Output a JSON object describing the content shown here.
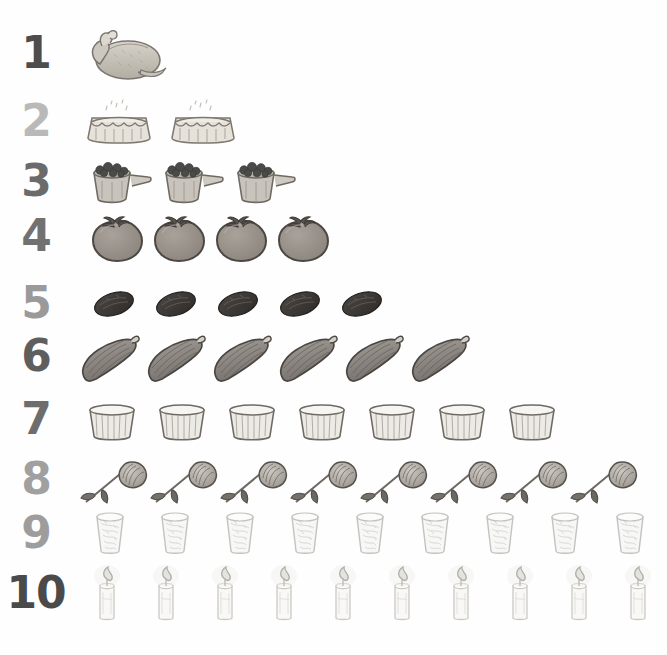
{
  "page": {
    "background_color": "#ffffff",
    "width": 667,
    "height": 655
  },
  "chart_data": {
    "type": "bar",
    "xlabel": "",
    "ylabel": "",
    "categories": [
      "1",
      "2",
      "3",
      "4",
      "5",
      "6",
      "7",
      "8",
      "9",
      "10"
    ],
    "values": [
      1,
      2,
      3,
      4,
      5,
      6,
      7,
      8,
      9,
      10
    ],
    "ylim": [
      0,
      10
    ],
    "grid": false,
    "legend": "none",
    "note": "Pictograph: each row shows N hand-drawn pictures matching its numeral"
  },
  "rows": [
    {
      "numeral": "1",
      "count": 1,
      "icon": "roast-turkey-icon",
      "item_label": "roast turkey",
      "numeral_color": "#4d4d4d",
      "item_width": 95,
      "item_height": 58,
      "gap": 6,
      "top": 22,
      "start_x": 78
    },
    {
      "numeral": "2",
      "count": 2,
      "icon": "pie-icon",
      "item_label": "pie",
      "numeral_color": "#b9b9b9",
      "item_width": 82,
      "item_height": 46,
      "gap": 2,
      "top": 90,
      "start_x": 78
    },
    {
      "numeral": "3",
      "count": 3,
      "icon": "measuring-cup-berries-icon",
      "item_label": "measuring cup of berries",
      "numeral_color": "#6b6b6b",
      "item_width": 72,
      "item_height": 52,
      "gap": 0,
      "top": 150,
      "start_x": 82
    },
    {
      "numeral": "4",
      "count": 4,
      "icon": "tomato-icon",
      "item_label": "tomato",
      "numeral_color": "#717171",
      "item_width": 62,
      "item_height": 58,
      "gap": 0,
      "top": 205,
      "start_x": 88
    },
    {
      "numeral": "5",
      "count": 5,
      "icon": "date-fruit-icon",
      "item_label": "date",
      "numeral_color": "#9a9a9a",
      "item_width": 62,
      "item_height": 40,
      "gap": 0,
      "top": 272,
      "start_x": 86
    },
    {
      "numeral": "6",
      "count": 6,
      "icon": "zucchini-icon",
      "item_label": "zucchini",
      "numeral_color": "#5e5e5e",
      "item_width": 66,
      "item_height": 58,
      "gap": 0,
      "top": 325,
      "start_x": 76
    },
    {
      "numeral": "7",
      "count": 7,
      "icon": "bowl-icon",
      "item_label": "bowl",
      "numeral_color": "#6d6d6d",
      "item_width": 70,
      "item_height": 50,
      "gap": 0,
      "top": 388,
      "start_x": 80
    },
    {
      "numeral": "8",
      "count": 8,
      "icon": "rose-icon",
      "item_label": "rose",
      "numeral_color": "#a0a0a0",
      "item_width": 70,
      "item_height": 54,
      "gap": 0,
      "top": 448,
      "start_x": 78
    },
    {
      "numeral": "9",
      "count": 9,
      "icon": "drinking-glass-icon",
      "item_label": "glass of water",
      "numeral_color": "#9d9d9d",
      "item_width": 65,
      "item_height": 52,
      "gap": 0,
      "top": 502,
      "start_x": 80
    },
    {
      "numeral": "10",
      "count": 10,
      "icon": "candle-icon",
      "item_label": "lit candle",
      "numeral_color": "#4a4a4a",
      "item_width": 59,
      "item_height": 58,
      "gap": 0,
      "top": 562,
      "start_x": 80
    }
  ]
}
